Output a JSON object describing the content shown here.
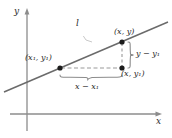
{
  "figure": {
    "axes": {
      "x_label": "x",
      "y_label": "y",
      "axis_color": "#8c8c8c"
    },
    "line": {
      "label": "l",
      "color": "#6b6b6b"
    },
    "points": [
      {
        "name": "point-x1-y1",
        "label_main": "(x",
        "label_sub1": "1",
        "label_mid": ", y",
        "label_sub2": "1",
        "label_end": ")",
        "cx": 60,
        "cy": 68
      },
      {
        "name": "point-x-y",
        "label_main": "(x",
        "label_mid": ", y)",
        "cx": 122,
        "cy": 42
      },
      {
        "name": "point-x-y1",
        "label_main": "(x",
        "label_mid": ", y",
        "label_sub2": "1",
        "label_end": ")",
        "cx": 122,
        "cy": 68
      }
    ],
    "labels": {
      "point_upper": "(x, y)",
      "point_lower_left": "(x₁, y₁)",
      "point_lower_right": "(x, y₁)",
      "rise": "y − y₁",
      "run": "x − x₁"
    },
    "colors": {
      "axis": "#8c8c8c",
      "line": "#6b6b6b",
      "dashed": "#9a9a9a",
      "brace": "#8c8c8c",
      "dot": "#1c1c1c",
      "text": "#2b2b2b"
    }
  }
}
